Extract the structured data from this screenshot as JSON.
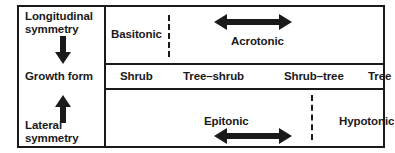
{
  "diagram": {
    "type": "conceptual-matrix-diagram",
    "axes": {
      "vertical_top_label": "Longitudinal\nsymmetry",
      "vertical_middle_label": "Growth form",
      "vertical_bottom_label": "Lateral\nsymmetry",
      "arrow_down": "down-arrow",
      "arrow_up": "up-arrow"
    },
    "rows": {
      "top": {
        "zones": [
          {
            "name": "Basitonic",
            "label": "Basitonic"
          },
          {
            "name": "Acrotonic",
            "label": "Acrotonic"
          }
        ],
        "divider": "dashed-vertical",
        "range_arrow": "double-headed-horizontal-arrow"
      },
      "middle": {
        "growth_forms": [
          "Shrub",
          "Tree–shrub",
          "Shrub–tree",
          "Tree"
        ]
      },
      "bottom": {
        "zones": [
          {
            "name": "Epitonic",
            "label": "Epitonic"
          },
          {
            "name": "Hypotonic",
            "label": "Hypotonic"
          }
        ],
        "divider": "dashed-vertical",
        "range_arrow": "double-headed-horizontal-arrow"
      }
    },
    "colors": {
      "ink": "#1a1a1a",
      "background": "#ffffff"
    }
  }
}
